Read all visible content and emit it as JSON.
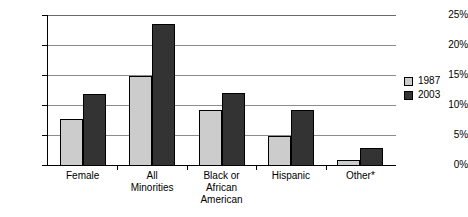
{
  "chart_data": {
    "type": "bar",
    "title": "",
    "xlabel": "",
    "ylabel": "",
    "ylim": [
      0,
      25
    ],
    "ytick_labels": [
      "0%",
      "5%",
      "10%",
      "15%",
      "20%",
      "25%"
    ],
    "ytick_values": [
      0,
      5,
      10,
      15,
      20,
      25
    ],
    "grid": true,
    "legend_position": "right",
    "categories": [
      "Female",
      "All\nMinorities",
      "Black or\nAfrican\nAmerican",
      "Hispanic",
      "Other*"
    ],
    "series": [
      {
        "name": "1987",
        "color": "#cccccc",
        "values": [
          7.7,
          14.8,
          9.2,
          4.8,
          0.9
        ]
      },
      {
        "name": "2003",
        "color": "#333333",
        "values": [
          11.8,
          23.5,
          12.0,
          9.2,
          2.9
        ]
      }
    ]
  },
  "legend": {
    "items": [
      {
        "label": "1987",
        "color": "#cccccc"
      },
      {
        "label": "2003",
        "color": "#333333"
      }
    ]
  },
  "colors": {
    "series_1987": "#cccccc",
    "series_2003": "#333333",
    "gridline": "#8c8c8c",
    "axis": "#000000",
    "background": "#ffffff"
  }
}
